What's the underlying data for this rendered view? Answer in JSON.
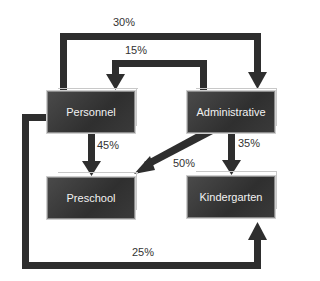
{
  "nodes": {
    "personnel": "Personnel",
    "administrative": "Administrative",
    "preschool": "Preschool",
    "kindergarten": "Kindergarten"
  },
  "edges": [
    {
      "from": "Personnel",
      "to": "Administrative",
      "label": "30%"
    },
    {
      "from": "Administrative",
      "to": "Personnel",
      "label": "15%"
    },
    {
      "from": "Personnel",
      "to": "Preschool",
      "label": "45%"
    },
    {
      "from": "Administrative",
      "to": "Preschool",
      "label": "50%"
    },
    {
      "from": "Administrative",
      "to": "Kindergarten",
      "label": "35%"
    },
    {
      "from": "Personnel",
      "to": "Kindergarten",
      "label": "25%"
    }
  ],
  "colors": {
    "arrow": "#2e2e2e",
    "node_fill": "#3a3a3a",
    "node_text": "#f2f2f2"
  }
}
